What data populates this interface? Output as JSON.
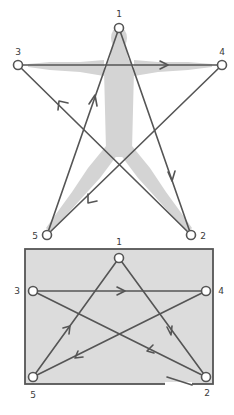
{
  "diagrams": [
    {
      "id": "star-figure",
      "description": "Five-point star traced over a human silhouette",
      "nodes": [
        {
          "id": "1",
          "label": "1"
        },
        {
          "id": "2",
          "label": "2"
        },
        {
          "id": "3",
          "label": "3"
        },
        {
          "id": "4",
          "label": "4"
        },
        {
          "id": "5",
          "label": "5"
        }
      ],
      "edges": [
        {
          "from": "1",
          "to": "2"
        },
        {
          "from": "2",
          "to": "3"
        },
        {
          "from": "3",
          "to": "4"
        },
        {
          "from": "4",
          "to": "5"
        },
        {
          "from": "5",
          "to": "1"
        }
      ]
    },
    {
      "id": "star-rectangle",
      "description": "Same five-point star traced inside a shaded rectangle",
      "nodes": [
        {
          "id": "1",
          "label": "1"
        },
        {
          "id": "2",
          "label": "2"
        },
        {
          "id": "3",
          "label": "3"
        },
        {
          "id": "4",
          "label": "4"
        },
        {
          "id": "5",
          "label": "5"
        }
      ],
      "edges": [
        {
          "from": "1",
          "to": "2"
        },
        {
          "from": "2",
          "to": "3"
        },
        {
          "from": "3",
          "to": "4"
        },
        {
          "from": "4",
          "to": "5"
        },
        {
          "from": "5",
          "to": "1"
        }
      ]
    }
  ],
  "colors": {
    "line": "#555555",
    "figure_fill": "#d4d4d4",
    "frame_fill": "#dcdcdc",
    "node_fill": "#ffffff"
  }
}
